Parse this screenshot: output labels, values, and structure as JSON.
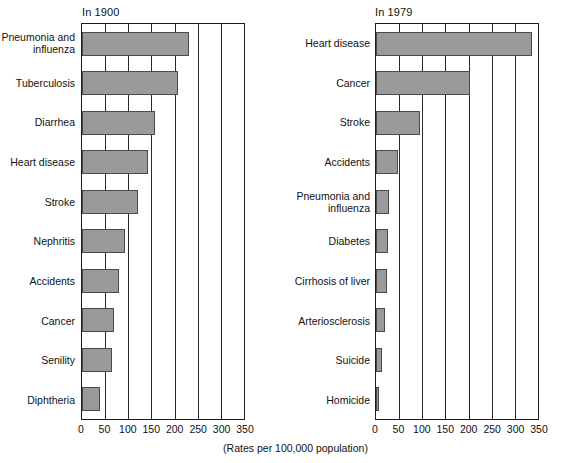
{
  "footnote": "(Rates per 100,000 population)",
  "axis": {
    "ticks": [
      0,
      50,
      100,
      150,
      200,
      250,
      300,
      350
    ],
    "min": 0,
    "max": 350
  },
  "panels": [
    {
      "title": "In 1900",
      "categories": [
        "Pneumonia and influenza",
        "Tuberculosis",
        "Diarrhea",
        "Heart disease",
        "Stroke",
        "Nephritis",
        "Accidents",
        "Cancer",
        "Senility",
        "Diphtheria"
      ],
      "values": [
        232,
        207,
        158,
        143,
        121,
        92,
        81,
        70,
        64,
        38
      ]
    },
    {
      "title": "In 1979",
      "categories": [
        "Heart disease",
        "Cancer",
        "Stroke",
        "Accidents",
        "Pneumonia and influenza",
        "Diabetes",
        "Cirrhosis of liver",
        "Arteriosclerosis",
        "Suicide",
        "Homicide"
      ],
      "values": [
        336,
        204,
        94,
        48,
        28,
        26,
        24,
        20,
        14,
        6
      ]
    }
  ],
  "chart_data": {
    "type": "bar",
    "orientation": "horizontal",
    "title": "",
    "subtitle": "",
    "xlabel": "(Rates per 100,000 population)",
    "ylabel": "",
    "xlim": [
      0,
      350
    ],
    "xticks": [
      0,
      50,
      100,
      150,
      200,
      250,
      300,
      350
    ],
    "grid": "vertical",
    "legend": "none",
    "panels": [
      {
        "title": "In 1900",
        "categories": [
          "Pneumonia and influenza",
          "Tuberculosis",
          "Diarrhea",
          "Heart disease",
          "Stroke",
          "Nephritis",
          "Accidents",
          "Cancer",
          "Senility",
          "Diphtheria"
        ],
        "values": [
          232,
          207,
          158,
          143,
          121,
          92,
          81,
          70,
          64,
          38
        ]
      },
      {
        "title": "In 1979",
        "categories": [
          "Heart disease",
          "Cancer",
          "Stroke",
          "Accidents",
          "Pneumonia and influenza",
          "Diabetes",
          "Cirrhosis of liver",
          "Arteriosclerosis",
          "Suicide",
          "Homicide"
        ],
        "values": [
          336,
          204,
          94,
          48,
          28,
          26,
          24,
          20,
          14,
          6
        ]
      }
    ],
    "colors": {
      "bar_fill": "#9a9a9a",
      "bar_stroke": "#4a4a4a",
      "axis": "#1c1c1c",
      "grid": "#2a2a2a",
      "text": "#111111",
      "background": "#ffffff"
    }
  }
}
